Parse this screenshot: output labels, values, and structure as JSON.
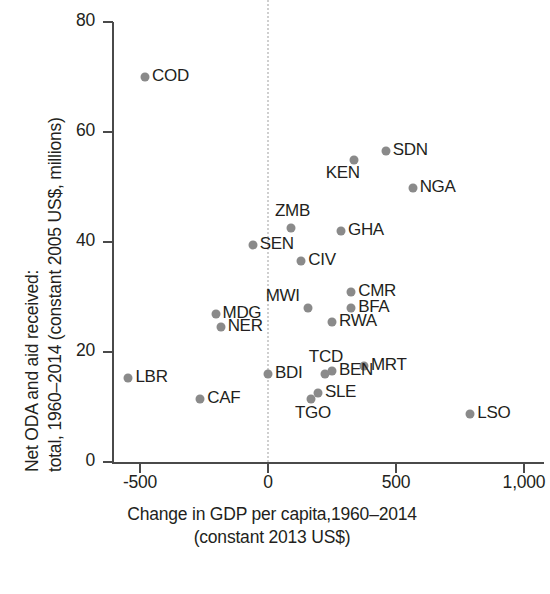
{
  "chart_data": {
    "type": "scatter",
    "title": "",
    "xlabel": "Change in GDP per capita,1960–2014 (constant 2013 US$)",
    "xlabel_lines": [
      "Change in GDP per capita,1960–2014",
      "(constant 2013 US$)"
    ],
    "ylabel": "Net ODA and aid received: total, 1960–2014 (constant 2005 US$, millions)",
    "ylabel_lines": [
      "Net ODA and aid received:",
      "total, 1960–2014 (constant 2005 US$, millions)"
    ],
    "xlim": [
      -620,
      1060
    ],
    "ylim": [
      -2,
      82
    ],
    "xticks": [
      -500,
      0,
      500,
      1000
    ],
    "xtick_labels": [
      "-500",
      "0",
      "500",
      "1,000"
    ],
    "yticks": [
      0,
      20,
      40,
      60,
      80
    ],
    "ytick_labels": [
      "0",
      "20",
      "40",
      "60",
      "80"
    ],
    "grid": false,
    "legend": "none",
    "reference_line": {
      "orientation": "vertical",
      "x": 0,
      "style": "dotted",
      "color": "#cfcfcf"
    },
    "marker_color": "#8a8a8a",
    "axis_color": "#4a4a4a",
    "points": [
      {
        "label": "COD",
        "x": -480,
        "y": 70.0,
        "label_pos": "right"
      },
      {
        "label": "SDN",
        "x": 460,
        "y": 56.5,
        "label_pos": "right"
      },
      {
        "label": "KEN",
        "x": 335,
        "y": 55.0,
        "label_pos": "below-left"
      },
      {
        "label": "NGA",
        "x": 565,
        "y": 49.8,
        "label_pos": "right"
      },
      {
        "label": "ZMB",
        "x": 90,
        "y": 42.5,
        "label_pos": "above"
      },
      {
        "label": "GHA",
        "x": 285,
        "y": 42.0,
        "label_pos": "right"
      },
      {
        "label": "SEN",
        "x": -60,
        "y": 39.5,
        "label_pos": "right"
      },
      {
        "label": "CIV",
        "x": 130,
        "y": 36.5,
        "label_pos": "right"
      },
      {
        "label": "CMR",
        "x": 325,
        "y": 31.0,
        "label_pos": "right"
      },
      {
        "label": "BFA",
        "x": 325,
        "y": 28.0,
        "label_pos": "right"
      },
      {
        "label": "MWI",
        "x": 155,
        "y": 28.0,
        "label_pos": "above-left"
      },
      {
        "label": "MDG",
        "x": -205,
        "y": 27.0,
        "label_pos": "right"
      },
      {
        "label": "RWA",
        "x": 250,
        "y": 25.5,
        "label_pos": "right"
      },
      {
        "label": "NER",
        "x": -185,
        "y": 24.5,
        "label_pos": "right"
      },
      {
        "label": "MRT",
        "x": 375,
        "y": 17.5,
        "label_pos": "right"
      },
      {
        "label": "TCD",
        "x": 222,
        "y": 16.0,
        "label_pos": "above"
      },
      {
        "label": "BEN",
        "x": 250,
        "y": 16.5,
        "label_pos": "right"
      },
      {
        "label": "BDI",
        "x": 0,
        "y": 16.0,
        "label_pos": "right"
      },
      {
        "label": "LBR",
        "x": -545,
        "y": 15.2,
        "label_pos": "right"
      },
      {
        "label": "SLE",
        "x": 195,
        "y": 12.5,
        "label_pos": "right"
      },
      {
        "label": "CAF",
        "x": -265,
        "y": 11.5,
        "label_pos": "right"
      },
      {
        "label": "TGO",
        "x": 168,
        "y": 11.5,
        "label_pos": "below"
      },
      {
        "label": "LSO",
        "x": 790,
        "y": 8.7,
        "label_pos": "right"
      }
    ]
  }
}
